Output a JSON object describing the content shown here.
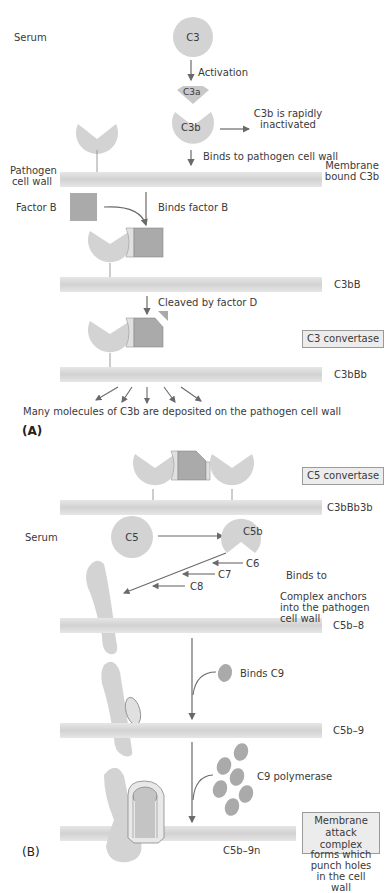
{
  "colors": {
    "protein_light": "#d3d3d3",
    "protein_dark": "#aaaaaa",
    "membrane": "#dcdcdc",
    "arrow": "#6a6a6a",
    "label_box": "#ececec"
  },
  "panel_a": {
    "label": "(A)",
    "serum": "Serum",
    "c3": "C3",
    "activation": "Activation",
    "c3a": "C3a",
    "c3b": "C3b",
    "c3b_inactivated": "C3b is rapidly inactivated",
    "binds_cell_wall": "Binds to pathogen cell wall",
    "pathogen_cell_wall": "Pathogen cell wall",
    "membrane_bound_c3b": "Membrane bound C3b",
    "factor_b": "Factor B",
    "binds_factor_b": "Binds factor B",
    "c3bb": "C3bB",
    "cleaved_by_factor_d": "Cleaved by factor D",
    "c3_convertase": "C3 convertase",
    "c3bbb": "C3bBb",
    "many_molecules": "Many molecules of C3b are deposited on the pathogen cell wall"
  },
  "panel_b": {
    "label": "(B)",
    "c5_convertase": "C5 convertase",
    "c3bbb3b": "C3bBb3b",
    "serum": "Serum",
    "c5": "C5",
    "c5b": "C5b",
    "c6": "C6",
    "c7": "C7",
    "c8": "C8",
    "binds_to": "Binds to",
    "complex_anchors": "Complex anchors into the pathogen cell wall",
    "c5b_8": "C5b–8",
    "binds_c9": "Binds C9",
    "c5b_9": "C5b–9",
    "c9_polymerase": "C9 polymerase",
    "membrane_attack_complex": "Membrane attack complex",
    "c5b_9n": "C5b–9n",
    "forms_holes": "forms which punch holes in the cell wall"
  }
}
